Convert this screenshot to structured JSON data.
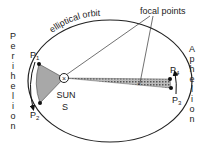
{
  "diagram": {
    "title_curved": "elliptical orbit",
    "focal_label": "focal points",
    "sun_label": "SUN",
    "sun_symbol": "S",
    "perihelion_letters": [
      "P",
      "e",
      "r",
      "i",
      "h",
      "e",
      "l",
      "i",
      "o",
      "n"
    ],
    "aphelion_letters": [
      "A",
      "p",
      "h",
      "e",
      "l",
      "i",
      "o",
      "n"
    ],
    "points": {
      "p1": "P",
      "p1_sub": "1",
      "p2": "P",
      "p2_sub": "2",
      "p3": "P",
      "p3_sub": "3",
      "p4": "P",
      "p4_sub": "4"
    },
    "colors": {
      "stroke": "#222222",
      "sector_fill": "#a8a8a8",
      "background": "#ffffff"
    }
  }
}
